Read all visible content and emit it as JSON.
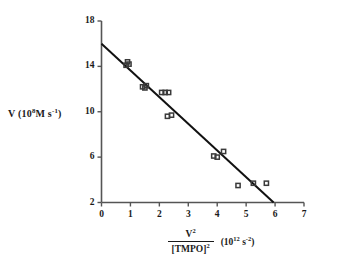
{
  "chart_data": {
    "type": "scatter",
    "title": "",
    "subtitle": "",
    "xlabel_numerator": "V",
    "xlabel_numerator_exp": "2",
    "xlabel_denominator": "[TMPO]",
    "xlabel_denominator_exp": "2",
    "xlabel_units_prefix": "(10",
    "xlabel_units_exp": "12",
    "xlabel_units_mid": "s",
    "xlabel_units_exp2": "-2",
    "xlabel_units_suffix": ")",
    "xlabel_plain": "V^2/[TMPO]^2  (10^12 s^-2)",
    "ylabel_prefix": "V (10",
    "ylabel_exp": "8",
    "ylabel_mid": "M s",
    "ylabel_exp2": "-1",
    "ylabel_suffix": ")",
    "ylabel_plain": "V (10^8 M s^-1)",
    "xlim": [
      0,
      7
    ],
    "ylim": [
      2,
      18
    ],
    "xticks": [
      0,
      1,
      2,
      3,
      4,
      5,
      6,
      7
    ],
    "xtick_labels": [
      "0",
      "1",
      "2",
      "3",
      "4",
      "5",
      "6",
      "7"
    ],
    "yticks": [
      2,
      6,
      10,
      14,
      18
    ],
    "ytick_labels": [
      "2",
      "6",
      "10",
      "14",
      "18"
    ],
    "grid": false,
    "legend": null,
    "marker": "open-square",
    "marker_color": "#3a3a3a",
    "line_color": "#111111",
    "axis_color": "#555555",
    "points": [
      {
        "x": 0.85,
        "y": 14.1
      },
      {
        "x": 0.9,
        "y": 14.4
      },
      {
        "x": 0.95,
        "y": 14.2
      },
      {
        "x": 1.42,
        "y": 12.2
      },
      {
        "x": 1.5,
        "y": 12.1
      },
      {
        "x": 1.55,
        "y": 12.3
      },
      {
        "x": 2.08,
        "y": 11.7
      },
      {
        "x": 2.2,
        "y": 11.7
      },
      {
        "x": 2.32,
        "y": 11.7
      },
      {
        "x": 2.28,
        "y": 9.6
      },
      {
        "x": 2.42,
        "y": 9.7
      },
      {
        "x": 3.88,
        "y": 6.1
      },
      {
        "x": 4.0,
        "y": 6.0
      },
      {
        "x": 4.22,
        "y": 6.5
      },
      {
        "x": 4.72,
        "y": 3.5
      },
      {
        "x": 5.25,
        "y": 3.7
      },
      {
        "x": 5.7,
        "y": 3.7
      }
    ],
    "fit_line": {
      "x_start": 0.0,
      "y_start": 16.0,
      "x_end": 5.95,
      "y_end": 2.0,
      "slope": -2.353,
      "intercept": 16.0
    }
  }
}
